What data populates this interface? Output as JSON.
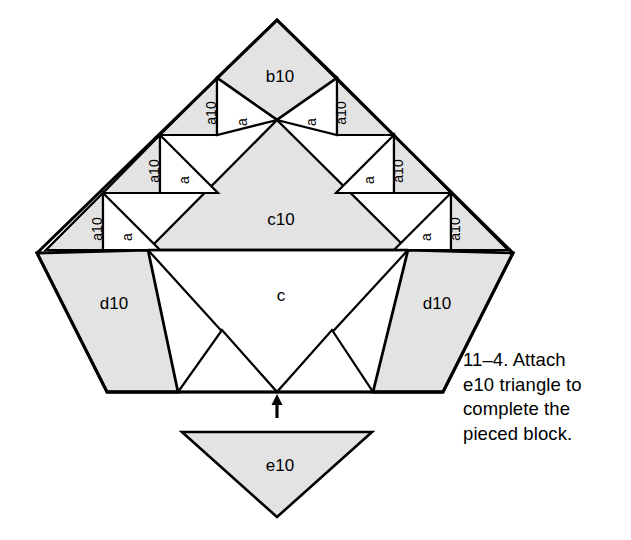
{
  "figure": {
    "caption_lines": [
      "11–4. Attach",
      "e10 triangle to",
      "complete the",
      "pieced block."
    ],
    "caption_full": "11–4. Attach e10 triangle to complete the pieced block."
  },
  "colors": {
    "shaded_fill": "#e3e3e3",
    "plain_fill": "#ffffff",
    "outline": "#000000",
    "background": "#ffffff",
    "text": "#000000"
  },
  "pieces": {
    "apex": {
      "label": "b10",
      "fill": "shaded"
    },
    "center_top": {
      "label": "c10",
      "fill": "shaded"
    },
    "center_bottom": {
      "label": "c",
      "fill": "plain"
    },
    "left_strip": {
      "label": "d10",
      "fill": "shaded"
    },
    "right_strip": {
      "label": "d10",
      "fill": "shaded"
    },
    "detached": {
      "label": "e10",
      "fill": "shaded"
    }
  },
  "edge_triangles": {
    "shaded_label": "a10",
    "plain_label": "a",
    "left_side": [
      {
        "label": "a10",
        "fill": "shaded"
      },
      {
        "label": "a",
        "fill": "plain"
      },
      {
        "label": "a10",
        "fill": "shaded"
      },
      {
        "label": "a",
        "fill": "plain"
      },
      {
        "label": "a10",
        "fill": "shaded"
      },
      {
        "label": "a",
        "fill": "plain"
      }
    ],
    "right_side": [
      {
        "label": "a",
        "fill": "plain"
      },
      {
        "label": "a10",
        "fill": "shaded"
      },
      {
        "label": "a",
        "fill": "plain"
      },
      {
        "label": "a10",
        "fill": "shaded"
      },
      {
        "label": "a",
        "fill": "plain"
      },
      {
        "label": "a10",
        "fill": "shaded"
      }
    ]
  },
  "annotation": {
    "arrow": "up-arrow",
    "arrow_meaning": "attach here"
  }
}
